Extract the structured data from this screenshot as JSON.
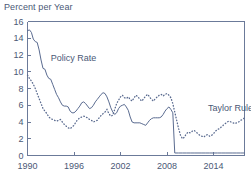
{
  "chart_data": {
    "type": "line",
    "title": "Percent per Year",
    "xlabel": "",
    "ylabel": "",
    "xlim": [
      1990,
      2018
    ],
    "ylim": [
      0,
      16
    ],
    "yticks": [
      0,
      2,
      4,
      6,
      8,
      10,
      12,
      14,
      16
    ],
    "xticks": [
      1990,
      1996,
      2002,
      2008,
      2014
    ],
    "xtick_labels": [
      "1990",
      "1996",
      "2002",
      "2008",
      "2014"
    ],
    "ytick_labels": [
      "0",
      "2",
      "4",
      "6",
      "8",
      "10",
      "12",
      "14",
      "16"
    ],
    "grid": false,
    "legend_position": "inline-annotations",
    "line_color": "#5a6b90",
    "text_color": "#4a5876",
    "axis_color": "#6b7a99",
    "series": [
      {
        "name": "Policy Rate",
        "style": "solid",
        "annotation": "Policy Rate",
        "annotation_x": 1993.0,
        "annotation_y": 11.3,
        "x": [
          1990.0,
          1990.25,
          1990.5,
          1990.75,
          1991.0,
          1991.25,
          1991.5,
          1991.75,
          1992.0,
          1992.25,
          1992.5,
          1992.75,
          1993.0,
          1993.25,
          1993.5,
          1993.75,
          1994.0,
          1994.25,
          1994.5,
          1994.75,
          1995.0,
          1995.25,
          1995.5,
          1995.75,
          1996.0,
          1996.25,
          1996.5,
          1996.75,
          1997.0,
          1997.25,
          1997.5,
          1997.75,
          1998.0,
          1998.25,
          1998.5,
          1998.75,
          1999.0,
          1999.25,
          1999.5,
          1999.75,
          2000.0,
          2000.25,
          2000.5,
          2000.75,
          2001.0,
          2001.25,
          2001.5,
          2001.75,
          2002.0,
          2002.25,
          2002.5,
          2002.75,
          2003.0,
          2003.25,
          2003.5,
          2003.75,
          2004.0,
          2004.25,
          2004.5,
          2004.75,
          2005.0,
          2005.25,
          2005.5,
          2005.75,
          2006.0,
          2006.25,
          2006.5,
          2006.75,
          2007.0,
          2007.25,
          2007.5,
          2007.75,
          2008.0,
          2008.25,
          2008.5,
          2008.75,
          2009.0,
          2009.5,
          2010.0,
          2010.5,
          2011.0,
          2011.5,
          2012.0,
          2012.5,
          2013.0,
          2013.5,
          2014.0,
          2014.5,
          2015.0,
          2015.5,
          2016.0,
          2016.5,
          2017.0,
          2017.5,
          2018.0
        ],
        "values": [
          14.9,
          15.0,
          14.7,
          13.9,
          13.6,
          13.5,
          12.6,
          11.4,
          10.4,
          10.3,
          9.6,
          9.2,
          9.1,
          8.5,
          7.9,
          7.3,
          6.9,
          6.4,
          6.0,
          5.9,
          5.9,
          5.8,
          5.3,
          5.1,
          5.1,
          5.3,
          5.6,
          5.9,
          6.3,
          6.4,
          6.2,
          5.9,
          5.6,
          5.7,
          6.0,
          6.4,
          6.7,
          7.0,
          7.3,
          7.5,
          7.4,
          7.0,
          6.4,
          5.7,
          5.2,
          4.9,
          5.1,
          5.6,
          5.9,
          6.0,
          6.1,
          5.8,
          5.4,
          4.6,
          4.0,
          3.9,
          3.9,
          3.9,
          3.9,
          3.8,
          3.7,
          3.6,
          3.9,
          4.2,
          4.4,
          4.5,
          4.5,
          4.5,
          4.5,
          4.6,
          4.9,
          5.3,
          5.6,
          5.8,
          5.5,
          5.1,
          0.3,
          0.3,
          0.3,
          0.3,
          0.3,
          0.3,
          0.3,
          0.3,
          0.3,
          0.3,
          0.3,
          0.3,
          0.3,
          0.3,
          0.3,
          0.3,
          0.3,
          0.3,
          0.3
        ]
      },
      {
        "name": "Taylor Rule",
        "style": "dotted",
        "annotation": "Taylor Rule",
        "annotation_x": 2013.3,
        "annotation_y": 5.3,
        "x": [
          1990.0,
          1990.25,
          1990.5,
          1990.75,
          1991.0,
          1991.25,
          1991.5,
          1991.75,
          1992.0,
          1992.25,
          1992.5,
          1992.75,
          1993.0,
          1993.25,
          1993.5,
          1993.75,
          1994.0,
          1994.25,
          1994.5,
          1994.75,
          1995.0,
          1995.25,
          1995.5,
          1995.75,
          1996.0,
          1996.25,
          1996.5,
          1996.75,
          1997.0,
          1997.25,
          1997.5,
          1997.75,
          1998.0,
          1998.25,
          1998.5,
          1998.75,
          1999.0,
          1999.25,
          1999.5,
          1999.75,
          2000.0,
          2000.25,
          2000.5,
          2000.75,
          2001.0,
          2001.25,
          2001.5,
          2001.75,
          2002.0,
          2002.25,
          2002.5,
          2002.75,
          2003.0,
          2003.25,
          2003.5,
          2003.75,
          2004.0,
          2004.25,
          2004.5,
          2004.75,
          2005.0,
          2005.25,
          2005.5,
          2005.75,
          2006.0,
          2006.25,
          2006.5,
          2006.75,
          2007.0,
          2007.25,
          2007.5,
          2007.75,
          2008.0,
          2008.25,
          2008.5,
          2008.75,
          2009.0,
          2009.25,
          2009.5,
          2009.75,
          2010.0,
          2010.25,
          2010.5,
          2010.75,
          2011.0,
          2011.25,
          2011.5,
          2011.75,
          2012.0,
          2012.25,
          2012.5,
          2012.75,
          2013.0,
          2013.25,
          2013.5,
          2013.75,
          2014.0,
          2014.25,
          2014.5,
          2014.75,
          2015.0,
          2015.25,
          2015.5,
          2015.75,
          2016.0,
          2016.25,
          2016.5,
          2016.75,
          2017.0,
          2017.25,
          2017.5,
          2017.75,
          2018.0
        ],
        "values": [
          9.6,
          9.2,
          8.9,
          8.5,
          8.0,
          7.4,
          6.8,
          6.2,
          5.6,
          5.3,
          5.0,
          4.6,
          4.4,
          4.3,
          4.2,
          4.1,
          4.2,
          4.3,
          4.0,
          3.7,
          3.5,
          3.3,
          3.2,
          3.4,
          3.6,
          4.0,
          4.3,
          4.5,
          4.6,
          4.7,
          4.6,
          4.5,
          4.3,
          4.2,
          4.0,
          4.1,
          4.2,
          4.5,
          4.8,
          5.0,
          5.2,
          5.5,
          5.0,
          4.7,
          4.8,
          5.5,
          6.2,
          6.6,
          7.0,
          7.2,
          6.9,
          6.8,
          7.0,
          6.7,
          6.5,
          6.9,
          7.2,
          7.0,
          6.7,
          6.5,
          6.8,
          7.1,
          7.3,
          7.0,
          6.7,
          6.5,
          6.8,
          7.0,
          7.2,
          7.3,
          7.1,
          7.3,
          7.4,
          7.2,
          6.9,
          6.2,
          5.2,
          4.2,
          3.2,
          2.4,
          2.0,
          2.2,
          2.6,
          2.8,
          2.7,
          2.9,
          3.0,
          2.8,
          2.6,
          2.4,
          2.3,
          2.2,
          2.4,
          2.5,
          2.3,
          2.4,
          2.6,
          2.9,
          3.1,
          3.2,
          3.4,
          3.6,
          3.8,
          4.0,
          4.1,
          4.0,
          3.9,
          3.8,
          3.9,
          4.0,
          4.2,
          4.3,
          4.5
        ]
      }
    ]
  }
}
